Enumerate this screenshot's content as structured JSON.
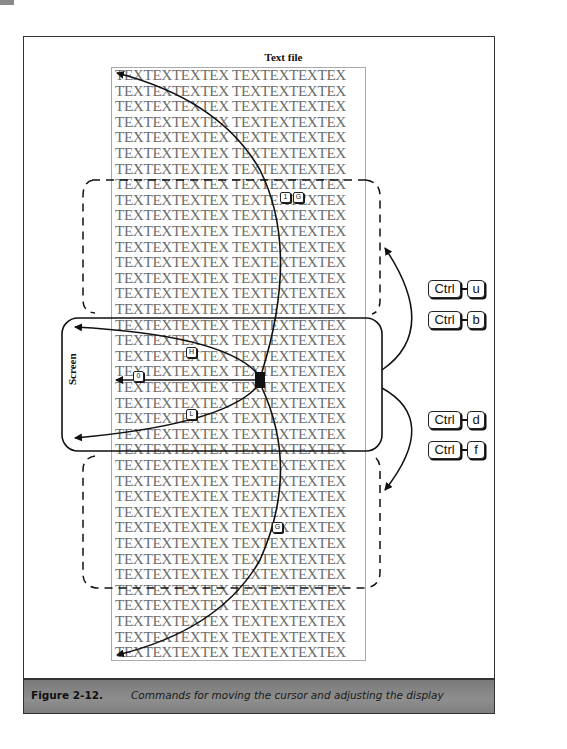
{
  "figure": {
    "title": "Text file",
    "screen_label": "Screen",
    "row_text": "TEXTEXTEXTEX TEXTEXTEXTEX",
    "row_count": 38,
    "caption_number": "Figure 2-12.",
    "caption_text": "Commands for moving the cursor and adjusting the display"
  },
  "keys": {
    "top_1": "1",
    "top_g": "G",
    "h": "H",
    "zero": "0",
    "l": "L",
    "g": "G"
  },
  "combos": [
    {
      "ctrl": "Ctrl",
      "letter": "u"
    },
    {
      "ctrl": "Ctrl",
      "letter": "b"
    },
    {
      "ctrl": "Ctrl",
      "letter": "d"
    },
    {
      "ctrl": "Ctrl",
      "letter": "f"
    }
  ],
  "colors": {
    "text_gray": "#6c6c6c",
    "caption_bg": "#808080",
    "ink": "#111111"
  }
}
